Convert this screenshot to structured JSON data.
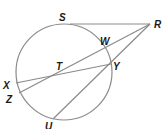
{
  "diagram": {
    "type": "circle with tangent and secants",
    "circle": {
      "cx": 64,
      "cy": 72,
      "r": 48
    },
    "colors": {
      "stroke": "#8a8a8a",
      "label": "#1a1a1a",
      "background": "#ffffff"
    },
    "points": {
      "S": {
        "label": "S",
        "x": 70,
        "y": 24,
        "lx": 59,
        "ly": 21
      },
      "R": {
        "label": "R",
        "x": 150,
        "y": 24,
        "lx": 154,
        "ly": 28
      },
      "W": {
        "label": "W",
        "x": 106,
        "y": 50,
        "lx": 100,
        "ly": 45
      },
      "Y": {
        "label": "Y",
        "x": 111,
        "y": 64,
        "lx": 113,
        "ly": 70
      },
      "T": {
        "label": "T",
        "x": 58,
        "y": 72,
        "lx": 56,
        "ly": 70
      },
      "X": {
        "label": "X",
        "x": 16,
        "y": 83,
        "lx": 3,
        "ly": 89
      },
      "Z": {
        "label": "Z",
        "x": 19,
        "y": 93,
        "lx": 6,
        "ly": 103
      },
      "U": {
        "label": "U",
        "x": 53,
        "y": 119,
        "lx": 45,
        "ly": 130
      }
    },
    "segments": [
      {
        "name": "tangent-RS",
        "from": "R",
        "to": "S"
      },
      {
        "name": "secant-RZ",
        "from": "R",
        "to": "Z"
      },
      {
        "name": "secant-RU",
        "from": "R",
        "to": "U"
      },
      {
        "name": "chord-XY",
        "from": "X",
        "to": "Y"
      }
    ]
  }
}
